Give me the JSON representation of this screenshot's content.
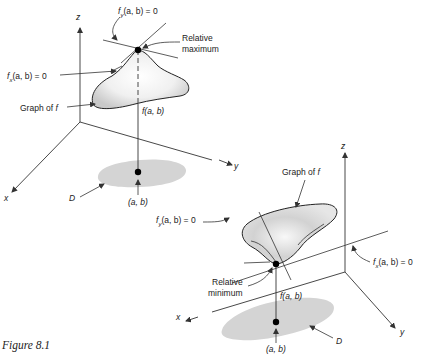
{
  "caption": "Figure 8.1",
  "left_panel": {
    "axis_z": "z",
    "axis_y": "y",
    "axis_x": "x",
    "fy_label": "f_y(a, b) = 0",
    "fy_main": "f",
    "fy_sub": "y",
    "fy_rest": "(a, b) = 0",
    "fx_main": "f",
    "fx_sub": "x",
    "fx_rest": "(a, b) = 0",
    "extremum_line1": "Relative",
    "extremum_line2": "maximum",
    "graph_label": "Graph of f",
    "graph_prefix": "Graph of ",
    "graph_f": "f",
    "height_label": "f(a, b)",
    "domain_label": "D",
    "point_label": "(a, b)"
  },
  "right_panel": {
    "axis_z": "z",
    "axis_y": "y",
    "axis_x": "x",
    "fy_main": "f",
    "fy_sub": "y",
    "fy_rest": "(a, b) = 0",
    "fx_main": "f",
    "fx_sub": "x",
    "fx_rest": "(a, b) = 0",
    "extremum_line1": "Relative",
    "extremum_line2": "minimum",
    "graph_prefix": "Graph of ",
    "graph_f": "f",
    "height_label": "f(a, b)",
    "domain_label": "D",
    "point_label": "(a, b)"
  }
}
